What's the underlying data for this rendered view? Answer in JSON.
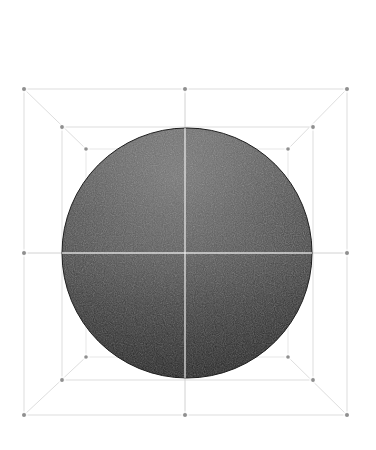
{
  "figure": {
    "caption": "",
    "background_color": "#ffffff",
    "line_color": "#d9d9d9",
    "faint_line_color": "#e3e3e3",
    "vertex_color": "#8f8f8f",
    "crosshair_color": "#efefef",
    "canvas": {
      "width": 376,
      "height": 450
    }
  },
  "chart_data": {
    "type": "scatter",
    "xlabel": "",
    "ylabel": "",
    "xlim": [
      0,
      376
    ],
    "ylim": [
      0,
      450
    ],
    "grid": false,
    "legend": "none",
    "annotations": [],
    "sphere": {
      "name": "shaded-sphere",
      "center_x": 187,
      "center_y": 253,
      "radius": 125,
      "top_y": 128,
      "bottom_y": 378,
      "left_x": 62,
      "right_x": 312,
      "light_direction": "top",
      "highlight_gray": "#6a6a6a",
      "midtone_gray": "#4a4a4a",
      "shadow_gray": "#232323",
      "texture": "halftone-dither"
    },
    "boxes": [
      {
        "name": "outer-box",
        "left": 24,
        "top": 89,
        "right": 347,
        "bottom": 415,
        "corners": [
          [
            24,
            89
          ],
          [
            347,
            89
          ],
          [
            347,
            415
          ],
          [
            24,
            415
          ]
        ],
        "edge_midpoints": [
          [
            185,
            89
          ],
          [
            347,
            253
          ],
          [
            185,
            415
          ],
          [
            24,
            253
          ]
        ]
      },
      {
        "name": "mid-box",
        "left": 62,
        "top": 127,
        "right": 313,
        "bottom": 380,
        "corners": [
          [
            62,
            127
          ],
          [
            313,
            127
          ],
          [
            313,
            380
          ],
          [
            62,
            380
          ]
        ],
        "edge_midpoints": []
      },
      {
        "name": "inner-box",
        "left": 86,
        "top": 149,
        "right": 288,
        "bottom": 357,
        "corners": [
          [
            86,
            149
          ],
          [
            288,
            149
          ],
          [
            288,
            357
          ],
          [
            86,
            357
          ]
        ],
        "edge_midpoints": []
      }
    ],
    "crosshair": {
      "name": "center-crosshair",
      "vertical_x": 185,
      "horizontal_y": 253,
      "vertical_span": [
        89,
        415
      ],
      "horizontal_span": [
        24,
        347
      ]
    },
    "diagonals": [
      {
        "from": [
          24,
          89
        ],
        "to": [
          86,
          149
        ]
      },
      {
        "from": [
          347,
          89
        ],
        "to": [
          288,
          149
        ]
      },
      {
        "from": [
          347,
          415
        ],
        "to": [
          288,
          357
        ]
      },
      {
        "from": [
          24,
          415
        ],
        "to": [
          86,
          357
        ]
      }
    ],
    "vertices": [
      {
        "x": 24,
        "y": 89,
        "label": "outer-top-left"
      },
      {
        "x": 185,
        "y": 89,
        "label": "outer-top-center"
      },
      {
        "x": 347,
        "y": 89,
        "label": "outer-top-right"
      },
      {
        "x": 24,
        "y": 253,
        "label": "outer-left-center"
      },
      {
        "x": 347,
        "y": 253,
        "label": "outer-right-center"
      },
      {
        "x": 24,
        "y": 415,
        "label": "outer-bottom-left"
      },
      {
        "x": 185,
        "y": 415,
        "label": "outer-bottom-center"
      },
      {
        "x": 347,
        "y": 415,
        "label": "outer-bottom-right"
      },
      {
        "x": 62,
        "y": 127,
        "label": "mid-top-left"
      },
      {
        "x": 313,
        "y": 127,
        "label": "mid-top-right"
      },
      {
        "x": 62,
        "y": 380,
        "label": "mid-bottom-left"
      },
      {
        "x": 313,
        "y": 380,
        "label": "mid-bottom-right"
      },
      {
        "x": 86,
        "y": 149,
        "label": "inner-top-left"
      },
      {
        "x": 288,
        "y": 149,
        "label": "inner-top-right"
      },
      {
        "x": 86,
        "y": 357,
        "label": "inner-bottom-left"
      },
      {
        "x": 288,
        "y": 357,
        "label": "inner-bottom-right"
      }
    ]
  }
}
